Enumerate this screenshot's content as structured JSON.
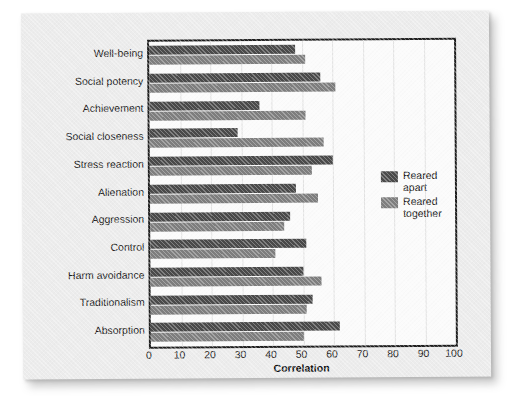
{
  "chart_data": {
    "type": "bar",
    "orientation": "horizontal",
    "title": "",
    "xlabel": "Correlation",
    "ylabel": "",
    "xlim": [
      0,
      100
    ],
    "xticks": [
      0,
      10,
      20,
      30,
      40,
      50,
      60,
      70,
      80,
      90,
      100
    ],
    "grid": true,
    "legend_position": "inside-right",
    "categories": [
      "Well-being",
      "Social potency",
      "Achievement",
      "Social closeness",
      "Stress reaction",
      "Alienation",
      "Aggression",
      "Control",
      "Harm avoidance",
      "Traditionalism",
      "Absorption"
    ],
    "series": [
      {
        "name": "Reared apart",
        "color": "#4a4a4a",
        "values": [
          48,
          56,
          36,
          29,
          60,
          48,
          46,
          51,
          50,
          53,
          62
        ]
      },
      {
        "name": "Reared together",
        "color": "#7e7e7e",
        "values": [
          51,
          61,
          51,
          57,
          53,
          55,
          44,
          41,
          56,
          51,
          50
        ]
      }
    ]
  },
  "legend": {
    "entries": [
      {
        "label_line1": "Reared",
        "label_line2": "apart",
        "color": "#4a4a4a"
      },
      {
        "label_line1": "Reared",
        "label_line2": "together",
        "color": "#7e7e7e"
      }
    ]
  },
  "colors": {
    "page_background": "#ffffff",
    "card_background": "#ececec",
    "plot_background": "#fbfbfb",
    "axis": "#1d1d1d",
    "gridline": "#e2e2e2",
    "text": "#1c1c1c"
  }
}
